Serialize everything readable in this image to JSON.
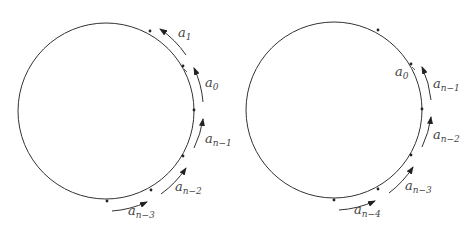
{
  "figure": {
    "left": {
      "labels": [
        {
          "base": "a",
          "sub": "1"
        },
        {
          "base": "a",
          "sub": "0"
        },
        {
          "base": "a",
          "sub": "n−1"
        },
        {
          "base": "a",
          "sub": "n−2"
        },
        {
          "base": "a",
          "sub": "n−3"
        }
      ]
    },
    "right": {
      "labels": [
        {
          "base": "a",
          "sub": "0"
        },
        {
          "base": "a",
          "sub": "n−1"
        },
        {
          "base": "a",
          "sub": "n−2"
        },
        {
          "base": "a",
          "sub": "n−3"
        },
        {
          "base": "a",
          "sub": "n−4"
        }
      ]
    },
    "colors": {
      "stroke": "#333333",
      "text": "#444444"
    }
  }
}
